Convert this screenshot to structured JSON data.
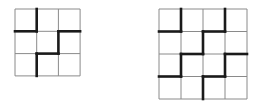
{
  "diagrams": [
    {
      "name": "grid-3x3",
      "rows": 3,
      "cols": 3,
      "origin": [
        15,
        9
      ],
      "cell": [
        21.7,
        22.3
      ],
      "thin_color": "#8a8a8a",
      "thick_color": "#1a1a1a",
      "thick_segments": [
        [
          [
            1,
            0
          ],
          [
            1,
            1
          ]
        ],
        [
          [
            0,
            1
          ],
          [
            1,
            1
          ]
        ],
        [
          [
            2,
            1
          ],
          [
            3,
            1
          ]
        ],
        [
          [
            2,
            1
          ],
          [
            2,
            2
          ]
        ],
        [
          [
            1,
            2
          ],
          [
            2,
            2
          ]
        ],
        [
          [
            1,
            2
          ],
          [
            1,
            3
          ]
        ]
      ]
    },
    {
      "name": "grid-4x4",
      "rows": 4,
      "cols": 4,
      "origin": [
        159,
        9
      ],
      "cell": [
        22,
        22.5
      ],
      "thin_color": "#8a8a8a",
      "thick_color": "#1a1a1a",
      "thick_segments": [
        [
          [
            1,
            0
          ],
          [
            1,
            1
          ]
        ],
        [
          [
            0,
            1
          ],
          [
            1,
            1
          ]
        ],
        [
          [
            3,
            0
          ],
          [
            3,
            1
          ]
        ],
        [
          [
            2,
            1
          ],
          [
            3,
            1
          ]
        ],
        [
          [
            2,
            1
          ],
          [
            2,
            2
          ]
        ],
        [
          [
            1,
            2
          ],
          [
            2,
            2
          ]
        ],
        [
          [
            1,
            2
          ],
          [
            1,
            3
          ]
        ],
        [
          [
            0,
            3
          ],
          [
            1,
            3
          ]
        ],
        [
          [
            3,
            2
          ],
          [
            4,
            2
          ]
        ],
        [
          [
            3,
            2
          ],
          [
            3,
            3
          ]
        ],
        [
          [
            2,
            3
          ],
          [
            3,
            3
          ]
        ],
        [
          [
            2,
            3
          ],
          [
            2,
            4
          ]
        ]
      ]
    }
  ]
}
